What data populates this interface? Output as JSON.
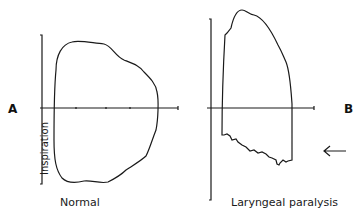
{
  "panels": [
    {
      "id": "A",
      "letter": "A",
      "caption": "Normal",
      "axis_label": "Inspiration"
    },
    {
      "id": "B",
      "letter": "B",
      "caption": "Laryngeal paralysis",
      "annotation": "arrow pointing to flattened inspiratory limb"
    }
  ],
  "colors": {
    "line": "#1a1a1a",
    "background": "#ffffff"
  }
}
